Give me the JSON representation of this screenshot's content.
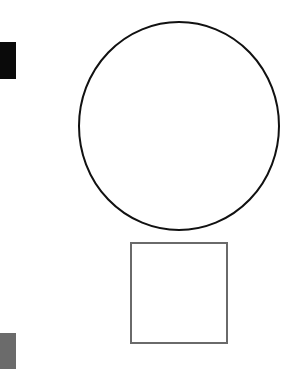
{
  "diagram": {
    "background": "#ffffff",
    "shapes": [
      {
        "id": "black-block",
        "type": "rect",
        "x": 0,
        "y": 42,
        "width": 16,
        "height": 37,
        "fill": "#0a0a0a"
      },
      {
        "id": "grey-block",
        "type": "rect",
        "x": 0,
        "y": 333,
        "width": 16,
        "height": 36,
        "fill": "#6b6b6b"
      },
      {
        "id": "circle",
        "type": "ellipse",
        "cx": 179,
        "cy": 126,
        "rx": 100,
        "ry": 104,
        "stroke": "#111111",
        "stroke_width": 2,
        "fill": "none"
      },
      {
        "id": "square",
        "type": "rect",
        "x": 131,
        "y": 243,
        "width": 96,
        "height": 100,
        "stroke": "#6a6a6a",
        "stroke_width": 2,
        "fill": "none"
      }
    ]
  }
}
